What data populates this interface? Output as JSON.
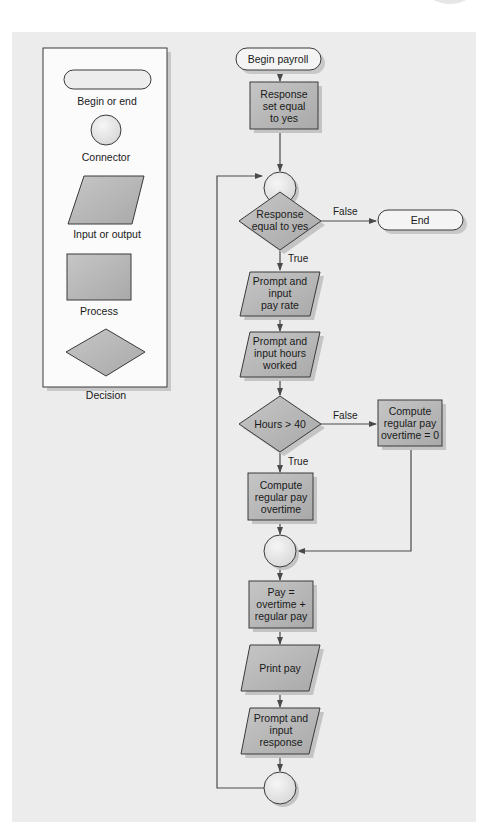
{
  "legend": {
    "items": [
      {
        "shape": "terminator",
        "label": "Begin or end"
      },
      {
        "shape": "connector",
        "label": "Connector"
      },
      {
        "shape": "parallelogram",
        "label": "Input or output"
      },
      {
        "shape": "rectangle",
        "label": "Process"
      },
      {
        "shape": "diamond",
        "label": "Decision"
      }
    ]
  },
  "flowchart": {
    "begin": "Begin payroll",
    "init": [
      "Response",
      "set equal",
      "to yes"
    ],
    "decision_response": [
      "Response",
      "equal to yes"
    ],
    "decision_response_false": "False",
    "decision_response_true": "True",
    "end": "End",
    "input_pay_rate": [
      "Prompt and",
      "input",
      "pay rate"
    ],
    "input_hours": [
      "Prompt and",
      "input hours",
      "worked"
    ],
    "decision_hours": "Hours > 40",
    "decision_hours_false": "False",
    "decision_hours_true": "True",
    "compute_no_overtime": [
      "Compute",
      "regular pay",
      "overtime = 0"
    ],
    "compute_overtime": [
      "Compute",
      "regular pay",
      "overtime"
    ],
    "pay_calc": [
      "Pay =",
      "overtime +",
      "regular pay"
    ],
    "print_pay": "Print pay",
    "input_response": [
      "Prompt and",
      "input",
      "response"
    ]
  },
  "colors": {
    "panel_bg": "#ececec",
    "shape_fill": "#b8b8b8",
    "terminator_fill": "#f4f4f4",
    "connector_fill": "#e8e8e8",
    "stroke": "#3a3a3a",
    "shadow": "#c4c4c4"
  }
}
